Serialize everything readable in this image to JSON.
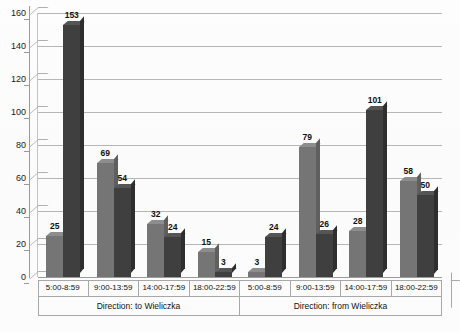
{
  "chart_data": {
    "type": "bar",
    "title": "",
    "xlabel": "",
    "ylabel": "",
    "ylim": [
      0,
      160
    ],
    "yticks": [
      0,
      20,
      40,
      60,
      80,
      100,
      120,
      140,
      160
    ],
    "grid": true,
    "legend": "none",
    "categories": [
      "5:00-8:59",
      "9:00-13:59",
      "14:00-17:59",
      "18:00-22:59",
      "5:00-8:59",
      "9:00-13:59",
      "14:00-17:59",
      "18:00-22:59"
    ],
    "group_labels": [
      "Direction: to Wieliczka",
      "Direction: from Wieliczka"
    ],
    "series": [
      {
        "name": "series-1",
        "color": "#757575",
        "values": [
          25,
          69,
          32,
          15,
          3,
          79,
          28,
          58
        ]
      },
      {
        "name": "series-2",
        "color": "#3f3f3f",
        "values": [
          153,
          54,
          24,
          3,
          24,
          26,
          101,
          50
        ]
      }
    ],
    "data_labels": [
      "25",
      "153",
      "69",
      "54",
      "32",
      "24",
      "15",
      "3",
      "3",
      "24",
      "79",
      "26",
      "28",
      "101",
      "58",
      "50"
    ]
  },
  "axis": {
    "y_tick_labels": [
      "160",
      "140",
      "120",
      "100",
      "80",
      "60",
      "40",
      "20",
      "0"
    ]
  }
}
